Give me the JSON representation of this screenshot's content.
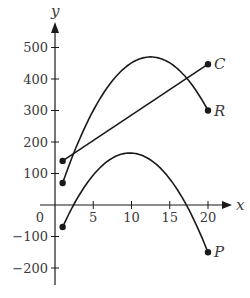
{
  "chart_data": {
    "type": "line",
    "title": "",
    "xlabel": "x",
    "ylabel": "y",
    "xlim": [
      0,
      21
    ],
    "ylim": [
      -250,
      560
    ],
    "x_ticks": [
      5,
      10,
      15,
      20
    ],
    "y_ticks": [
      -200,
      -100,
      100,
      200,
      300,
      400,
      500
    ],
    "x_tick_labels": [
      "0",
      "5",
      "10",
      "15",
      "20"
    ],
    "y_tick_labels": [
      "500",
      "400",
      "300",
      "200",
      "100",
      "−100",
      "−200"
    ],
    "origin_label": "0",
    "grid": false,
    "legend": "none (series labeled at line endpoints)",
    "series": [
      {
        "name": "C",
        "kind": "linear",
        "x": [
          1,
          20
        ],
        "y": [
          140,
          447
        ]
      },
      {
        "name": "R",
        "kind": "quadratic",
        "x": [
          1,
          5,
          10,
          12.5,
          15,
          20
        ],
        "y": [
          70,
          300,
          451,
          470,
          451,
          300
        ],
        "vertex": [
          12.5,
          470
        ]
      },
      {
        "name": "P",
        "kind": "quadratic",
        "x": [
          1,
          5,
          9.8,
          15,
          17.2,
          20
        ],
        "y": [
          -70,
          95,
          165,
          83,
          0,
          -150
        ],
        "vertex": [
          9.8,
          165
        ]
      }
    ]
  },
  "axes": {
    "x_label": "x",
    "y_label": "y",
    "origin": "0",
    "x_ticks": [
      {
        "value": 5,
        "label": "5"
      },
      {
        "value": 10,
        "label": "10"
      },
      {
        "value": 15,
        "label": "15"
      },
      {
        "value": 20,
        "label": "20"
      }
    ],
    "y_ticks": [
      {
        "value": 500,
        "label": "500"
      },
      {
        "value": 400,
        "label": "400"
      },
      {
        "value": 300,
        "label": "300"
      },
      {
        "value": 200,
        "label": "200"
      },
      {
        "value": 100,
        "label": "100"
      },
      {
        "value": -100,
        "label": "−100"
      },
      {
        "value": -200,
        "label": "−200"
      }
    ]
  },
  "labels": {
    "C": "C",
    "R": "R",
    "P": "P"
  },
  "colors": {
    "line": "#1a1a1a",
    "text": "#3a3a3a",
    "background": "#ffffff"
  }
}
